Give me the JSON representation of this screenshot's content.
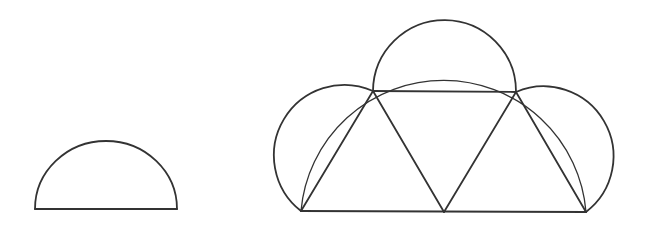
{
  "diagram": {
    "stroke_color": "#333333",
    "background_color": "#ffffff",
    "stroke_width": 1.8,
    "thin_stroke_width": 1.3,
    "small_semicircle": {
      "center": [
        106,
        209
      ],
      "rx": 71,
      "ry": 68,
      "base_left": [
        35,
        209
      ],
      "base_right": [
        177,
        209
      ]
    },
    "trapezoid": {
      "vertices": {
        "A_bottom_left": [
          301,
          211
        ],
        "B_bottom_middle": [
          444,
          212
        ],
        "C_bottom_right": [
          586,
          212
        ],
        "D_top_left": [
          373,
          91
        ],
        "E_top_right": [
          516,
          92
        ]
      },
      "equilateral_triangles": 3,
      "side_length": 143
    },
    "large_semicircle": {
      "center": [
        444,
        212
      ],
      "radius": 143
    },
    "side_semicircles": [
      {
        "on_side": "AD",
        "from": [
          301,
          211
        ],
        "to": [
          373,
          91
        ],
        "radius": 71
      },
      {
        "on_side": "DE",
        "from": [
          373,
          91
        ],
        "to": [
          516,
          92
        ],
        "radius": 71.5
      },
      {
        "on_side": "EC",
        "from": [
          516,
          92
        ],
        "to": [
          586,
          212
        ],
        "radius": 71
      }
    ]
  }
}
